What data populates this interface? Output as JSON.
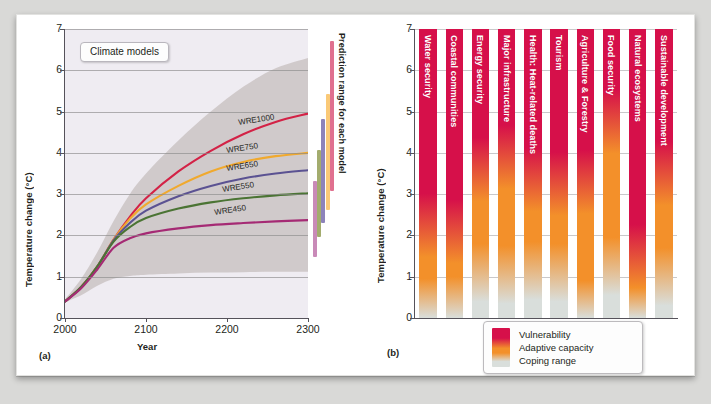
{
  "figure": {
    "background_color": "#d9d9d7",
    "page_color": "#ffffff"
  },
  "panel_a": {
    "tag": "(a)",
    "callout": "Climate models",
    "axis": {
      "ylabel": "Temperature change (°C)",
      "xlabel": "Year",
      "yticks": [
        "0",
        "1",
        "2",
        "3",
        "4",
        "5",
        "6",
        "7"
      ],
      "ylim": [
        0,
        7
      ],
      "xticks": [
        "2000",
        "2100",
        "2200",
        "2300"
      ],
      "xlim": [
        2000,
        2300
      ],
      "grid": "horizontal",
      "plot_background": "#efecf2"
    },
    "band_label": "model uncertainty range",
    "band_color": "#c9c2c2",
    "range_title": "Prediction range for each model"
  },
  "panel_b": {
    "tag": "(b)",
    "axis": {
      "ylabel": "Temperature change (°C)",
      "yticks": [
        "0",
        "1",
        "2",
        "3",
        "4",
        "5",
        "6",
        "7"
      ],
      "ylim": [
        0,
        7
      ],
      "grid": "horizontal"
    },
    "legend": {
      "items": [
        "Vulnerability",
        "Adaptive capacity",
        "Coping range"
      ],
      "colors": [
        "#d6104a",
        "#f3902a",
        "#d9dedb"
      ]
    }
  },
  "chart_data": [
    {
      "type": "line",
      "panel": "(a)",
      "title": "Climate models",
      "xlabel": "Year",
      "ylabel": "Temperature change (°C)",
      "xlim": [
        2000,
        2300
      ],
      "ylim": [
        0,
        7
      ],
      "xticks": [
        2000,
        2100,
        2200,
        2300
      ],
      "yticks": [
        0,
        1,
        2,
        3,
        4,
        5,
        6,
        7
      ],
      "grid": true,
      "legend_position": "inline-curve-labels",
      "x": [
        2000,
        2020,
        2040,
        2060,
        2080,
        2100,
        2140,
        2180,
        2220,
        2260,
        2300
      ],
      "series": [
        {
          "name": "WRE1000",
          "color": "#d32246",
          "label_x": 2215,
          "label_y": 4.62,
          "values": [
            0.4,
            0.75,
            1.25,
            1.9,
            2.45,
            2.9,
            3.55,
            4.05,
            4.45,
            4.75,
            4.95
          ]
        },
        {
          "name": "WRE750",
          "color": "#f0a92e",
          "label_x": 2200,
          "label_y": 3.95,
          "values": [
            0.4,
            0.75,
            1.25,
            1.9,
            2.4,
            2.75,
            3.2,
            3.55,
            3.78,
            3.92,
            4.0
          ]
        },
        {
          "name": "WRE650",
          "color": "#5b5292",
          "label_x": 2200,
          "label_y": 3.52,
          "values": [
            0.4,
            0.75,
            1.25,
            1.88,
            2.3,
            2.6,
            2.95,
            3.2,
            3.38,
            3.5,
            3.58
          ]
        },
        {
          "name": "WRE550",
          "color": "#4b7434",
          "label_x": 2195,
          "label_y": 3.0,
          "values": [
            0.4,
            0.75,
            1.25,
            1.85,
            2.2,
            2.42,
            2.65,
            2.8,
            2.9,
            2.97,
            3.02
          ]
        },
        {
          "name": "WRE450",
          "color": "#a52a74",
          "label_x": 2185,
          "label_y": 2.45,
          "values": [
            0.4,
            0.72,
            1.18,
            1.7,
            1.93,
            2.05,
            2.17,
            2.25,
            2.3,
            2.34,
            2.37
          ]
        }
      ],
      "uncertainty_band": {
        "name": "Prediction range (shaded)",
        "color": "#c9c2c2",
        "upper": [
          0.45,
          0.95,
          1.6,
          2.35,
          3.0,
          3.5,
          4.3,
          5.0,
          5.6,
          6.05,
          6.3
        ],
        "lower": [
          0.38,
          0.55,
          0.78,
          0.95,
          1.02,
          1.05,
          1.08,
          1.1,
          1.11,
          1.12,
          1.12
        ]
      },
      "prediction_range_bars": {
        "title": "Prediction range for each model",
        "bars": [
          {
            "name": "WRE450",
            "color": "#c98ab8",
            "low": 1.48,
            "high": 3.32
          },
          {
            "name": "WRE550",
            "color": "#a3ac6e",
            "low": 1.95,
            "high": 4.08
          },
          {
            "name": "WRE650",
            "color": "#8d83ba",
            "low": 2.3,
            "high": 4.82
          },
          {
            "name": "WRE750",
            "color": "#fac977",
            "low": 2.62,
            "high": 5.42
          },
          {
            "name": "WRE1000",
            "color": "#e0708f",
            "low": 3.08,
            "high": 6.72
          }
        ]
      }
    },
    {
      "type": "heatmap",
      "panel": "(b)",
      "ylabel": "Temperature change (°C)",
      "ylim": [
        0,
        7
      ],
      "yticks": [
        0,
        1,
        2,
        3,
        4,
        5,
        6,
        7
      ],
      "grid": true,
      "legend_position": "bottom-center",
      "colors": {
        "vulnerability": "#d6104a",
        "adaptive_capacity": "#f3902a",
        "coping_range": "#d9dedb"
      },
      "categories": [
        "Water security",
        "Coastal communities",
        "Energy security",
        "Major infrastructure",
        "Health: Heat-related deaths",
        "Tourism",
        "Agriculture & Forestry",
        "Food security",
        "Natural ecosystems",
        "Sustainable development"
      ],
      "series": [
        {
          "name": "coping-to-adaptive threshold (°C)",
          "values": [
            0.25,
            0.3,
            1.1,
            1.05,
            1.15,
            1.1,
            0.2,
            1.25,
            0.65,
            1.0
          ]
        },
        {
          "name": "adaptive-to-vulnerability threshold (°C)",
          "values": [
            2.25,
            2.1,
            3.6,
            3.9,
            3.35,
            3.25,
            3.3,
            4.75,
            1.5,
            3.5
          ]
        }
      ]
    }
  ]
}
